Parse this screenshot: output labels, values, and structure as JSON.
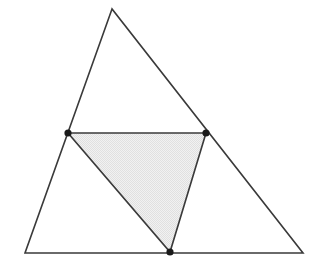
{
  "figure": {
    "type": "geometric-diagram",
    "canvas": {
      "width": 323,
      "height": 271,
      "background": "#ffffff"
    },
    "colors": {
      "stroke": "#3a3a3a",
      "shade_fill": "#ececec",
      "vertex_dot": "#1a1a1a",
      "background": "#ffffff"
    },
    "stroke_width": 1.6,
    "vertex_dot_radius": 3.6,
    "outer_triangle": {
      "name": "outer-triangle",
      "filled": false,
      "points": "112,9 25,253 303,253",
      "vertices": [
        {
          "label": "apex",
          "x": 112,
          "y": 9
        },
        {
          "label": "bottom-left",
          "x": 25,
          "y": 253
        },
        {
          "label": "bottom-right",
          "x": 303,
          "y": 253
        }
      ]
    },
    "shaded_triangle": {
      "name": "shaded-triangle",
      "filled": true,
      "points": "68,133 206,133 170,252",
      "vertices": [
        {
          "label": "left-midpoint",
          "x": 68,
          "y": 133
        },
        {
          "label": "right-midpoint",
          "x": 206,
          "y": 133
        },
        {
          "label": "base-midpoint",
          "x": 170,
          "y": 252
        }
      ]
    },
    "marked_points": [
      {
        "name": "point-left",
        "x": 68,
        "y": 133
      },
      {
        "name": "point-right",
        "x": 206,
        "y": 133
      },
      {
        "name": "point-bottom",
        "x": 170,
        "y": 252
      }
    ]
  }
}
